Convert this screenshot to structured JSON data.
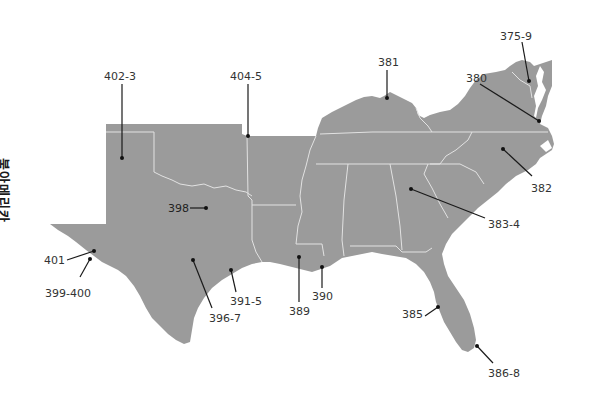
{
  "region_title": "북아메리카",
  "colors": {
    "land": "#9b9b9b",
    "borders": "#e2e2e2",
    "leader": "#1a1a1a",
    "label_text": "#333333",
    "background": "#ffffff"
  },
  "callouts": [
    {
      "id": "375-9",
      "label": "375-9",
      "region": "Maryland / Delaware"
    },
    {
      "id": "380",
      "label": "380",
      "region": "Virginia"
    },
    {
      "id": "381",
      "label": "381",
      "region": "Kentucky"
    },
    {
      "id": "382",
      "label": "382",
      "region": "North Carolina"
    },
    {
      "id": "383-4",
      "label": "383-4",
      "region": "Georgia"
    },
    {
      "id": "385",
      "label": "385",
      "region": "Florida west coast"
    },
    {
      "id": "386-8",
      "label": "386-8",
      "region": "South Florida"
    },
    {
      "id": "389",
      "label": "389",
      "region": "Louisiana"
    },
    {
      "id": "390",
      "label": "390",
      "region": "New Orleans"
    },
    {
      "id": "391-5",
      "label": "391-5",
      "region": "Houston / Texas Gulf"
    },
    {
      "id": "396-7",
      "label": "396-7",
      "region": "Central Texas"
    },
    {
      "id": "398",
      "label": "398",
      "region": "Dallas / North Texas"
    },
    {
      "id": "399-400",
      "label": "399-400",
      "region": "West Texas"
    },
    {
      "id": "401",
      "label": "401",
      "region": "El Paso"
    },
    {
      "id": "402-3",
      "label": "402-3",
      "region": "Texas Panhandle"
    },
    {
      "id": "404-5",
      "label": "404-5",
      "region": "Arkansas"
    }
  ]
}
